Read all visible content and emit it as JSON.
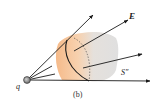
{
  "diagram": {
    "caption": "(b)",
    "charge": {
      "label": "q"
    },
    "field": {
      "label": "E"
    },
    "surface": {
      "label": "S″"
    },
    "colors": {
      "line": "#1a1a1a",
      "surface_warm": "#f2b27a",
      "surface_cool": "#d9d9d9",
      "charge_fill": "#8a8a8a"
    }
  }
}
